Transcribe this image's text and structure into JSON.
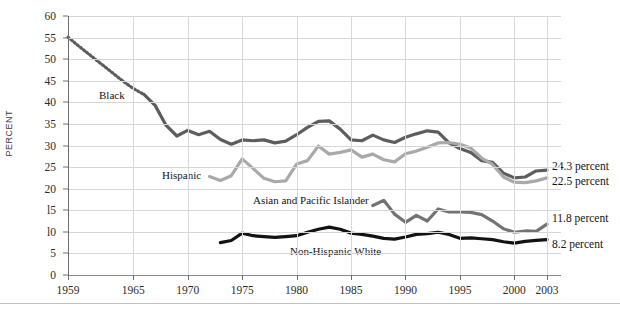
{
  "chart_data": {
    "type": "line",
    "title": "",
    "xlabel": "",
    "ylabel": "PERCENT",
    "ylim": [
      0,
      60
    ],
    "xlim": [
      1959,
      2003
    ],
    "yticks": [
      0,
      5,
      10,
      15,
      20,
      25,
      30,
      35,
      40,
      45,
      50,
      55,
      60
    ],
    "ytick_labels": [
      "0",
      "5",
      "l0",
      "l5",
      "20",
      "25",
      "30",
      "35",
      "40",
      "45",
      "50",
      "55",
      "60"
    ],
    "xticks": [
      1959,
      1965,
      1970,
      1975,
      1980,
      1985,
      1990,
      1995,
      2000,
      2003
    ],
    "xtick_labels": [
      "1959",
      "1965",
      "1970",
      "1975",
      "1980",
      "1985",
      "1990",
      "1995",
      "2000",
      "2003"
    ],
    "grid": true,
    "legend_position": "inline-annotations",
    "series": [
      {
        "name": "Black",
        "color": "#5d5d5d",
        "label": "Black",
        "end_value_label": "24.3 percent",
        "dashed_until": 1966,
        "x": [
          1959,
          1960,
          1961,
          1962,
          1963,
          1964,
          1965,
          1966,
          1967,
          1968,
          1969,
          1970,
          1971,
          1972,
          1973,
          1974,
          1975,
          1976,
          1977,
          1978,
          1979,
          1980,
          1981,
          1982,
          1983,
          1984,
          1985,
          1986,
          1987,
          1988,
          1989,
          1990,
          1991,
          1992,
          1993,
          1994,
          1995,
          1996,
          1997,
          1998,
          1999,
          2000,
          2001,
          2002,
          2003
        ],
        "y": [
          55.1,
          53.0,
          51.0,
          49.0,
          47.0,
          45.0,
          43.2,
          41.8,
          39.3,
          34.7,
          32.2,
          33.5,
          32.5,
          33.3,
          31.4,
          30.3,
          31.3,
          31.1,
          31.3,
          30.6,
          31.0,
          32.5,
          34.2,
          35.6,
          35.7,
          33.8,
          31.3,
          31.1,
          32.4,
          31.3,
          30.7,
          31.9,
          32.7,
          33.4,
          33.1,
          30.6,
          29.3,
          28.4,
          26.5,
          26.1,
          23.6,
          22.5,
          22.7,
          24.1,
          24.3
        ]
      },
      {
        "name": "Hispanic",
        "color": "#a9a9a9",
        "label": "Hispanic",
        "end_value_label": "22.5 percent",
        "x": [
          1972,
          1973,
          1974,
          1975,
          1976,
          1977,
          1978,
          1979,
          1980,
          1981,
          1982,
          1983,
          1984,
          1985,
          1986,
          1987,
          1988,
          1989,
          1990,
          1991,
          1992,
          1993,
          1994,
          1995,
          1996,
          1997,
          1998,
          1999,
          2000,
          2001,
          2002,
          2003
        ],
        "y": [
          22.8,
          21.9,
          23.0,
          26.9,
          24.7,
          22.4,
          21.6,
          21.8,
          25.7,
          26.5,
          29.9,
          28.0,
          28.4,
          29.0,
          27.3,
          28.0,
          26.7,
          26.2,
          28.1,
          28.7,
          29.6,
          30.6,
          30.7,
          30.3,
          29.4,
          27.1,
          25.6,
          22.7,
          21.5,
          21.4,
          21.8,
          22.5
        ]
      },
      {
        "name": "Asian and Pacific Islander",
        "color": "#737373",
        "label": "Asian and Pacific Islander",
        "end_value_label": "11.8 percent",
        "x": [
          1987,
          1988,
          1989,
          1990,
          1991,
          1992,
          1993,
          1994,
          1995,
          1996,
          1997,
          1998,
          1999,
          2000,
          2001,
          2002,
          2003
        ],
        "y": [
          16.1,
          17.3,
          14.1,
          12.2,
          13.8,
          12.5,
          15.3,
          14.6,
          14.6,
          14.5,
          14.0,
          12.5,
          10.7,
          9.9,
          10.2,
          10.1,
          11.8
        ]
      },
      {
        "name": "Non-Hispanic White",
        "color": "#121212",
        "label": "Non-Hispanic White",
        "end_value_label": "8.2 percent",
        "x": [
          1973,
          1974,
          1975,
          1976,
          1977,
          1978,
          1979,
          1980,
          1981,
          1982,
          1983,
          1984,
          1985,
          1986,
          1987,
          1988,
          1989,
          1990,
          1991,
          1992,
          1993,
          1994,
          1995,
          1996,
          1997,
          1998,
          1999,
          2000,
          2001,
          2002,
          2003
        ],
        "y": [
          7.5,
          8.0,
          9.7,
          9.1,
          8.9,
          8.7,
          8.9,
          9.1,
          9.9,
          10.6,
          11.1,
          10.6,
          9.7,
          9.4,
          9.0,
          8.5,
          8.3,
          8.8,
          9.4,
          9.6,
          9.9,
          9.4,
          8.5,
          8.6,
          8.4,
          8.2,
          7.7,
          7.4,
          7.8,
          8.0,
          8.2
        ]
      }
    ]
  },
  "annotations": {
    "black_label": "Black",
    "hispanic_label": "Hispanic",
    "asian_label": "Asian and Pacific Islander",
    "white_label": "Non-Hispanic White"
  },
  "end_labels": [
    {
      "text": "24.3 percent"
    },
    {
      "text": "22.5 percent"
    },
    {
      "text": "11.8 percent"
    },
    {
      "text": "8.2 percent"
    }
  ],
  "colors": {
    "black_series": "#5d5d5d",
    "hispanic_series": "#a9a9a9",
    "asian_series": "#737373",
    "white_series": "#121212",
    "grid": "#d6d6d6",
    "axis": "#6e6e6e"
  }
}
